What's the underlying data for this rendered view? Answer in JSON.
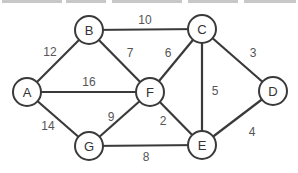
{
  "diagram": {
    "type": "weighted-undirected-graph",
    "colors": {
      "stroke": "#3a3a3a",
      "node_fill": "#ffffff",
      "label": "#555555"
    },
    "nodes": [
      {
        "id": "A",
        "label": "A",
        "x": 27,
        "y": 92
      },
      {
        "id": "B",
        "label": "B",
        "x": 89,
        "y": 30
      },
      {
        "id": "C",
        "label": "C",
        "x": 202,
        "y": 29
      },
      {
        "id": "D",
        "label": "D",
        "x": 273,
        "y": 91
      },
      {
        "id": "E",
        "label": "E",
        "x": 202,
        "y": 145
      },
      {
        "id": "F",
        "label": "F",
        "x": 150,
        "y": 92
      },
      {
        "id": "G",
        "label": "G",
        "x": 89,
        "y": 146
      }
    ],
    "edges": [
      {
        "from": "A",
        "to": "B",
        "weight": "12",
        "lx": 50,
        "ly": 52
      },
      {
        "from": "A",
        "to": "F",
        "weight": "16",
        "lx": 89,
        "ly": 82
      },
      {
        "from": "A",
        "to": "G",
        "weight": "14",
        "lx": 48,
        "ly": 126
      },
      {
        "from": "B",
        "to": "C",
        "weight": "10",
        "lx": 145,
        "ly": 20
      },
      {
        "from": "B",
        "to": "F",
        "weight": "7",
        "lx": 130,
        "ly": 53
      },
      {
        "from": "C",
        "to": "F",
        "weight": "6",
        "lx": 168,
        "ly": 53
      },
      {
        "from": "C",
        "to": "E",
        "weight": "5",
        "lx": 215,
        "ly": 91
      },
      {
        "from": "C",
        "to": "D",
        "weight": "3",
        "lx": 253,
        "ly": 53
      },
      {
        "from": "F",
        "to": "E",
        "weight": "2",
        "lx": 163,
        "ly": 121
      },
      {
        "from": "F",
        "to": "G",
        "weight": "9",
        "lx": 111,
        "ly": 117
      },
      {
        "from": "G",
        "to": "E",
        "weight": "8",
        "lx": 146,
        "ly": 157
      },
      {
        "from": "E",
        "to": "D",
        "weight": "4",
        "lx": 252,
        "ly": 132
      }
    ]
  }
}
